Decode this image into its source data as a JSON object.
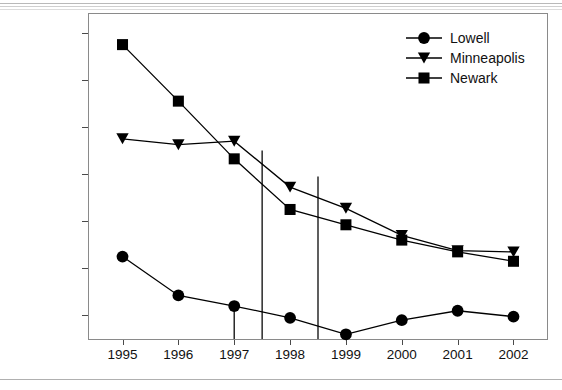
{
  "figure": {
    "y_axis_title": "Index crimes/100,000",
    "x_ticks": [
      "1995",
      "1996",
      "1997",
      "1998",
      "1999",
      "2000",
      "2001",
      "2002"
    ],
    "y_ticks": [
      "4000",
      "6000",
      "8000",
      "10000",
      "12000",
      "14000",
      "16000"
    ]
  },
  "legend": {
    "position": "top-right",
    "items": [
      {
        "label": "Lowell",
        "marker": "circle-marker",
        "color": "#000000"
      },
      {
        "label": "Minneapolis",
        "marker": "triangle-down-marker",
        "color": "#000000"
      },
      {
        "label": "Newark",
        "marker": "square-marker",
        "color": "#000000"
      }
    ]
  },
  "chart_data": {
    "type": "line",
    "title": "",
    "xlabel": "",
    "ylabel": "Index crimes/100,000",
    "categories": [
      1995,
      1996,
      1997,
      1998,
      1999,
      2000,
      2001,
      2002
    ],
    "xlim": [
      1994.4,
      2002.6
    ],
    "ylim": [
      3000,
      16800
    ],
    "grid": false,
    "legend_position": "top-right",
    "series": [
      {
        "name": "Lowell",
        "marker": "circle",
        "color": "#000000",
        "values": [
          6500,
          4850,
          4400,
          3900,
          3200,
          3800,
          4200,
          3950
        ]
      },
      {
        "name": "Minneapolis",
        "marker": "triangle-down",
        "color": "#000000",
        "values": [
          11500,
          11250,
          11400,
          9450,
          8550,
          7400,
          6750,
          6700
        ]
      },
      {
        "name": "Newark",
        "marker": "square",
        "color": "#000000",
        "values": [
          15500,
          13100,
          10650,
          8500,
          7850,
          7200,
          6700,
          6300
        ]
      }
    ],
    "annotations": [
      {
        "name": "reference-line-1997",
        "type": "vline",
        "x": 1997.0,
        "y_top": 4400,
        "y_bottom": 3000
      },
      {
        "name": "reference-line-1997-5",
        "type": "vline",
        "x": 1997.5,
        "y_top": 11000,
        "y_bottom": 3000
      },
      {
        "name": "reference-line-1998-5",
        "type": "vline",
        "x": 1998.5,
        "y_top": 9900,
        "y_bottom": 3000
      }
    ]
  }
}
